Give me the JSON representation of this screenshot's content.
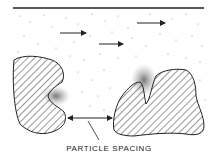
{
  "figure": {
    "label": "PARTICLE SPACING",
    "colors": {
      "ink": "#222222",
      "background": "#ffffff"
    },
    "elements": {
      "boundary_line": "top surface line",
      "flow_arrows": 3,
      "particles": 2,
      "spacing_indicator": "double-headed arrow between particles"
    }
  }
}
